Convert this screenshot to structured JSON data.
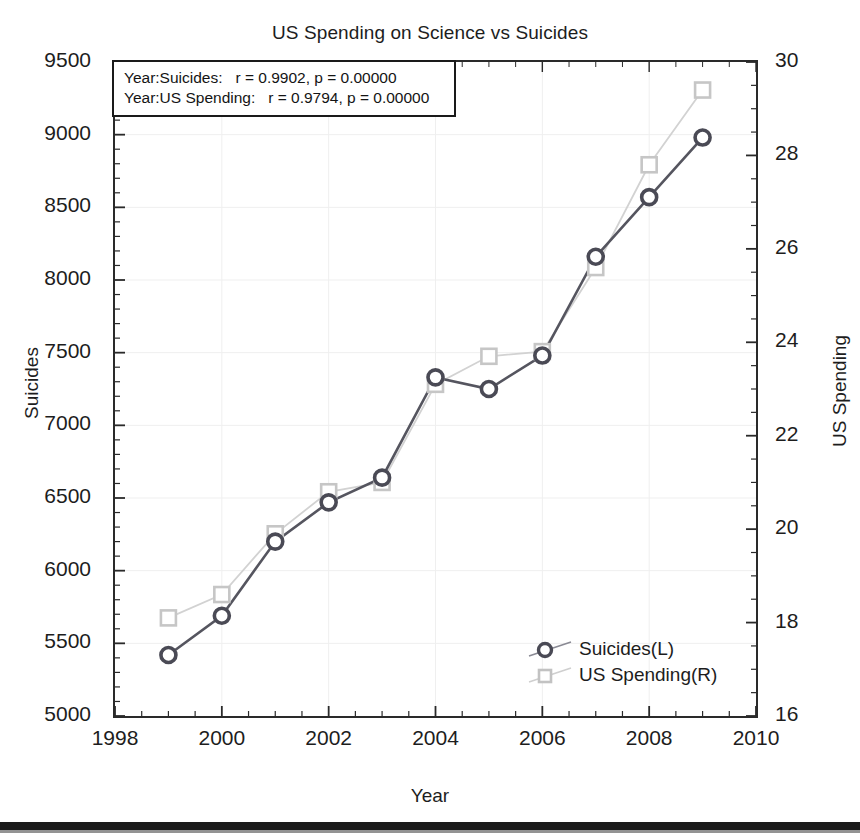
{
  "chart_data": {
    "type": "line",
    "title": "US Spending on Science vs Suicides",
    "xlabel": "Year",
    "ylabel": "Suicides",
    "y2label": "US Spending",
    "x": [
      1999,
      2000,
      2001,
      2002,
      2003,
      2004,
      2005,
      2006,
      2007,
      2008,
      2009
    ],
    "xlim": [
      1998,
      2010
    ],
    "xticks": [
      "1998",
      "2000",
      "2002",
      "2004",
      "2006",
      "2008",
      "2010"
    ],
    "xtick_values": [
      1998,
      2000,
      2002,
      2004,
      2006,
      2008,
      2010
    ],
    "ylim": [
      5000,
      9500
    ],
    "yticks": [
      "5000",
      "5500",
      "6000",
      "6500",
      "7000",
      "7500",
      "8000",
      "8500",
      "9000",
      "9500"
    ],
    "ytick_values": [
      5000,
      5500,
      6000,
      6500,
      7000,
      7500,
      8000,
      8500,
      9000,
      9500
    ],
    "y2lim": [
      16,
      30
    ],
    "y2ticks": [
      "16",
      "18",
      "20",
      "22",
      "24",
      "26",
      "28",
      "30"
    ],
    "y2tick_values": [
      16,
      18,
      20,
      22,
      24,
      26,
      28,
      30
    ],
    "grid": true,
    "legend_position": "lower-right",
    "series": [
      {
        "name": "Suicides(L)",
        "axis": "left",
        "marker": "circle",
        "color": "#5b5b66",
        "values": [
          5420,
          5690,
          6200,
          6470,
          6640,
          7330,
          7250,
          7480,
          8160,
          8570,
          8980
        ]
      },
      {
        "name": "US Spending(R)",
        "axis": "right",
        "marker": "square",
        "color": "#bdbdbd",
        "values": [
          18.1,
          18.6,
          19.9,
          20.8,
          21.0,
          23.1,
          23.7,
          23.8,
          25.6,
          27.8,
          29.4
        ]
      }
    ],
    "annotations": [
      "Year:Suicides:   r = 0.9902, p = 0.00000",
      "Year:US Spending:   r = 0.9794, p = 0.00000"
    ]
  },
  "legend": {
    "items": [
      {
        "label": "Suicides(L)"
      },
      {
        "label": "US Spending(R)"
      }
    ]
  },
  "colors": {
    "series_suicides": "#5b5b66",
    "series_spending": "#bdbdbd",
    "axis": "#2a2a2a",
    "grid": "#efefef",
    "text": "#1d1d1d"
  }
}
